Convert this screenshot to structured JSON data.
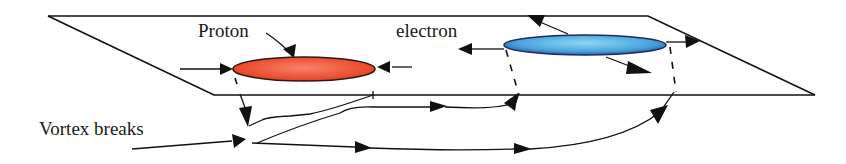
{
  "figure": {
    "labels": {
      "proton": "Proton",
      "electron": "electron",
      "vortex_breaks": "Vortex breaks"
    },
    "colors": {
      "proton_fill_center": "#f8826a",
      "proton_fill_edge": "#e53a1c",
      "electron_fill_center": "#8fd8f6",
      "electron_fill_edge": "#2d5da8",
      "line": "#111111",
      "background": "#ffffff"
    },
    "elements": {
      "plane": "parallelogram-plane",
      "proton_disk": "red-ellipse",
      "electron_disk": "blue-ellipse",
      "vortex_lines": "arrowed-flow-lines"
    }
  }
}
